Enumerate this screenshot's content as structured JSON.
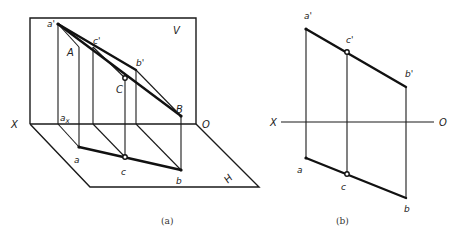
{
  "figure_a": {
    "caption": "(a)",
    "plane_v_label": "V",
    "plane_h_label": "H",
    "axis_x_label": "X",
    "axis_o_label": "O",
    "points": {
      "a_prime": "a'",
      "c_prime": "c'",
      "b_prime": "b'",
      "A": "A",
      "C": "C",
      "B": "B",
      "a": "a",
      "c": "c",
      "b": "b",
      "ax": "a",
      "ax_sub": "x"
    }
  },
  "figure_b": {
    "caption": "(b)",
    "axis_x_label": "X",
    "axis_o_label": "O",
    "points": {
      "a_prime": "a'",
      "c_prime": "c'",
      "b_prime": "b'",
      "a": "a",
      "c": "c",
      "b": "b"
    }
  }
}
